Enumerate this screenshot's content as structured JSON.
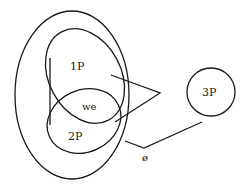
{
  "diagram": {
    "type": "venn-like set diagram",
    "sets": [
      {
        "id": "outer",
        "label": ""
      },
      {
        "id": "first-person",
        "label": "1P"
      },
      {
        "id": "second-person",
        "label": "2P"
      },
      {
        "id": "third-person",
        "label": "3P"
      }
    ],
    "intersection_label": "we",
    "empty_set_label": "ø",
    "colors": {
      "stroke": "#1a1a1a",
      "background": "#ffffff"
    }
  }
}
